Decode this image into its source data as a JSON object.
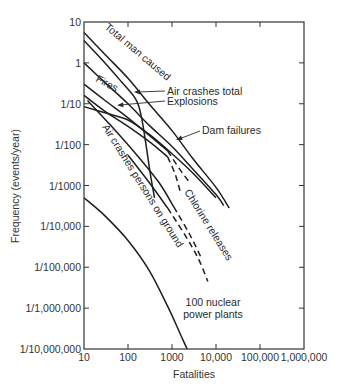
{
  "chart_data": {
    "type": "line",
    "title": "",
    "xlabel": "Fatalities",
    "ylabel": "Frequency (events/year)",
    "xscale": "log",
    "yscale": "log",
    "xlim": [
      10,
      1000000
    ],
    "ylim": [
      1e-07,
      10
    ],
    "grid": false,
    "legend": "inline labels",
    "x_ticks": [
      {
        "value": 10,
        "label": "10"
      },
      {
        "value": 100,
        "label": "100"
      },
      {
        "value": 1000,
        "label": "1000"
      },
      {
        "value": 10000,
        "label": "10,000"
      },
      {
        "value": 100000,
        "label": "100,000"
      },
      {
        "value": 1000000,
        "label": "1,000,000"
      }
    ],
    "y_ticks": [
      {
        "value": 10,
        "label": "10"
      },
      {
        "value": 1,
        "label": "1"
      },
      {
        "value": 0.1,
        "label": "1/10"
      },
      {
        "value": 0.01,
        "label": "1/100"
      },
      {
        "value": 0.001,
        "label": "1/1000"
      },
      {
        "value": 0.0001,
        "label": "1/10,000"
      },
      {
        "value": 1e-05,
        "label": "1/100,000"
      },
      {
        "value": 1e-06,
        "label": "1/1,000,000"
      },
      {
        "value": 1e-07,
        "label": "1/10,000,000"
      }
    ],
    "series": [
      {
        "name": "Total man caused",
        "style": "solid",
        "points": [
          [
            10,
            5.5
          ],
          [
            30,
            1.6
          ],
          [
            100,
            0.42
          ],
          [
            300,
            0.1
          ],
          [
            1000,
            0.022
          ],
          [
            3000,
            0.0045
          ],
          [
            10000,
            0.0009
          ],
          [
            20000,
            0.00028
          ]
        ]
      },
      {
        "name": "Air crashes total",
        "style": "solid",
        "points": [
          [
            10,
            3.5
          ],
          [
            30,
            1.0
          ],
          [
            70,
            0.35
          ],
          [
            150,
            0.13
          ],
          [
            200,
            0.05
          ],
          [
            250,
            0.012
          ],
          [
            320,
            0.002
          ],
          [
            400,
            0.0005
          ]
        ]
      },
      {
        "name": "Explosions",
        "style": "solid",
        "points": [
          [
            10,
            1.0
          ],
          [
            30,
            0.33
          ],
          [
            100,
            0.1
          ],
          [
            300,
            0.03
          ],
          [
            1000,
            0.009
          ],
          [
            3000,
            0.0025
          ],
          [
            10000,
            0.0006
          ],
          [
            15000,
            0.00032
          ]
        ]
      },
      {
        "name": "Fires",
        "style": "solid-then-dashed",
        "dash_from": 800,
        "points": [
          [
            10,
            0.3
          ],
          [
            30,
            0.12
          ],
          [
            100,
            0.045
          ],
          [
            300,
            0.017
          ],
          [
            800,
            0.007
          ],
          [
            1500,
            0.0025
          ],
          [
            2500,
            0.0012
          ]
        ]
      },
      {
        "name": "Dam failures",
        "style": "solid-then-dashed",
        "dash_from": 800,
        "points": [
          [
            10,
            0.16
          ],
          [
            30,
            0.065
          ],
          [
            100,
            0.028
          ],
          [
            300,
            0.012
          ],
          [
            800,
            0.005
          ],
          [
            1200,
            0.0018
          ],
          [
            1600,
            0.0006
          ]
        ]
      },
      {
        "name": "Air crashes persons on ground",
        "style": "solid",
        "points": [
          [
            10,
            0.085
          ],
          [
            30,
            0.06
          ],
          [
            100,
            0.04
          ],
          [
            300,
            0.018
          ],
          [
            1000,
            0.006
          ],
          [
            3000,
            0.002
          ],
          [
            10000,
            0.0005
          ]
        ]
      },
      {
        "name": "Chlorine releases (upper)",
        "style": "solid-then-dashed",
        "dash_from": 1100,
        "points": [
          [
            12,
            0.12
          ],
          [
            40,
            0.03
          ],
          [
            150,
            0.006
          ],
          [
            500,
            0.0012
          ],
          [
            1100,
            0.0003
          ],
          [
            2500,
            6.5e-05
          ],
          [
            4500,
            1.8e-05
          ]
        ]
      },
      {
        "name": "Chlorine releases (lower)",
        "style": "solid-then-dashed",
        "dash_from": 800,
        "points": [
          [
            100,
            0.0055
          ],
          [
            300,
            0.0012
          ],
          [
            800,
            0.00028
          ],
          [
            2000,
            6e-05
          ],
          [
            4000,
            1.6e-05
          ],
          [
            6500,
            4.5e-06
          ]
        ]
      },
      {
        "name": "100 nuclear power plants",
        "style": "solid",
        "points": [
          [
            10,
            0.0005
          ],
          [
            30,
            0.00018
          ],
          [
            100,
            4.5e-05
          ],
          [
            300,
            8.5e-06
          ],
          [
            800,
            1.1e-06
          ],
          [
            1500,
            2.5e-07
          ],
          [
            2200,
            1e-07
          ]
        ]
      }
    ],
    "annotations": [
      {
        "text": "Total man caused",
        "rotation": 40
      },
      {
        "text": "Air crashes total",
        "arrow": true
      },
      {
        "text": "Explosions",
        "arrow": true
      },
      {
        "text": "Fires",
        "rotation": 28
      },
      {
        "text": "Dam failures",
        "arrow": true
      },
      {
        "text": "Air crashes persons on ground",
        "rotation": 58
      },
      {
        "text": "Chlorine releases",
        "rotation": 58
      },
      {
        "text": "100 nuclear",
        "line2": "power plants"
      }
    ]
  },
  "labels": {
    "total": "Total man caused",
    "air_total": "Air crashes total",
    "explosions": "Explosions",
    "fires": "Fires",
    "dam": "Dam failures",
    "air_ground": "Air crashes persons on ground",
    "chlorine": "Chlorine releases",
    "nuclear_1": "100 nuclear",
    "nuclear_2": "power plants"
  }
}
